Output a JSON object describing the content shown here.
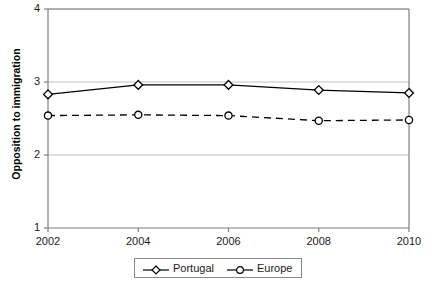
{
  "chart_data": {
    "type": "line",
    "title": "",
    "xlabel": "",
    "ylabel": "Opposition to immigration",
    "x": [
      2002,
      2004,
      2006,
      2008,
      2010
    ],
    "xticklabels": [
      "2002",
      "2004",
      "2006",
      "2008",
      "2010"
    ],
    "yticklabels": [
      "1",
      "2",
      "3",
      "4"
    ],
    "yticks": [
      1,
      2,
      3,
      4
    ],
    "xlim": [
      2002,
      2010
    ],
    "ylim": [
      1,
      4
    ],
    "grid": "horizontal",
    "legend_position": "bottom-center",
    "series": [
      {
        "name": "Portugal",
        "marker": "diamond",
        "linestyle": "solid",
        "color": "#000000",
        "values": [
          2.83,
          2.96,
          2.96,
          2.89,
          2.85
        ]
      },
      {
        "name": "Europe",
        "marker": "circle",
        "linestyle": "dashed",
        "color": "#000000",
        "values": [
          2.54,
          2.55,
          2.54,
          2.47,
          2.48
        ]
      }
    ]
  },
  "legend": {
    "items": [
      {
        "label": "Portugal"
      },
      {
        "label": "Europe"
      }
    ]
  },
  "axes": {
    "frame_color": "#7f7f7f",
    "grid_color": "#bfbfbf"
  }
}
